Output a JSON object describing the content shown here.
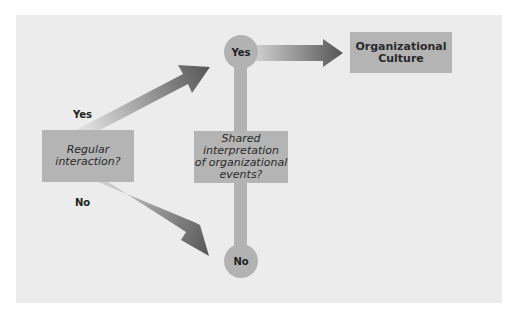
{
  "diagram": {
    "decision_1": {
      "text": "Regular interaction?"
    },
    "decision_1_lines": [
      "Regular",
      "interaction?"
    ],
    "decision_2_lines": [
      "Shared",
      "interpretation",
      "of organizational",
      "events?"
    ],
    "outcome": {
      "lines": [
        "Organizational",
        "Culture"
      ]
    },
    "branch_labels": {
      "yes": "Yes",
      "no": "No"
    },
    "nodes": {
      "yes": "Yes",
      "no": "No"
    },
    "colors": {
      "background": "#ececec",
      "box": "#b4b4b4",
      "node": "#b2b2b2",
      "arrow_dark": "#5a5a5a",
      "arrow_light": "#d4d4d4"
    }
  }
}
